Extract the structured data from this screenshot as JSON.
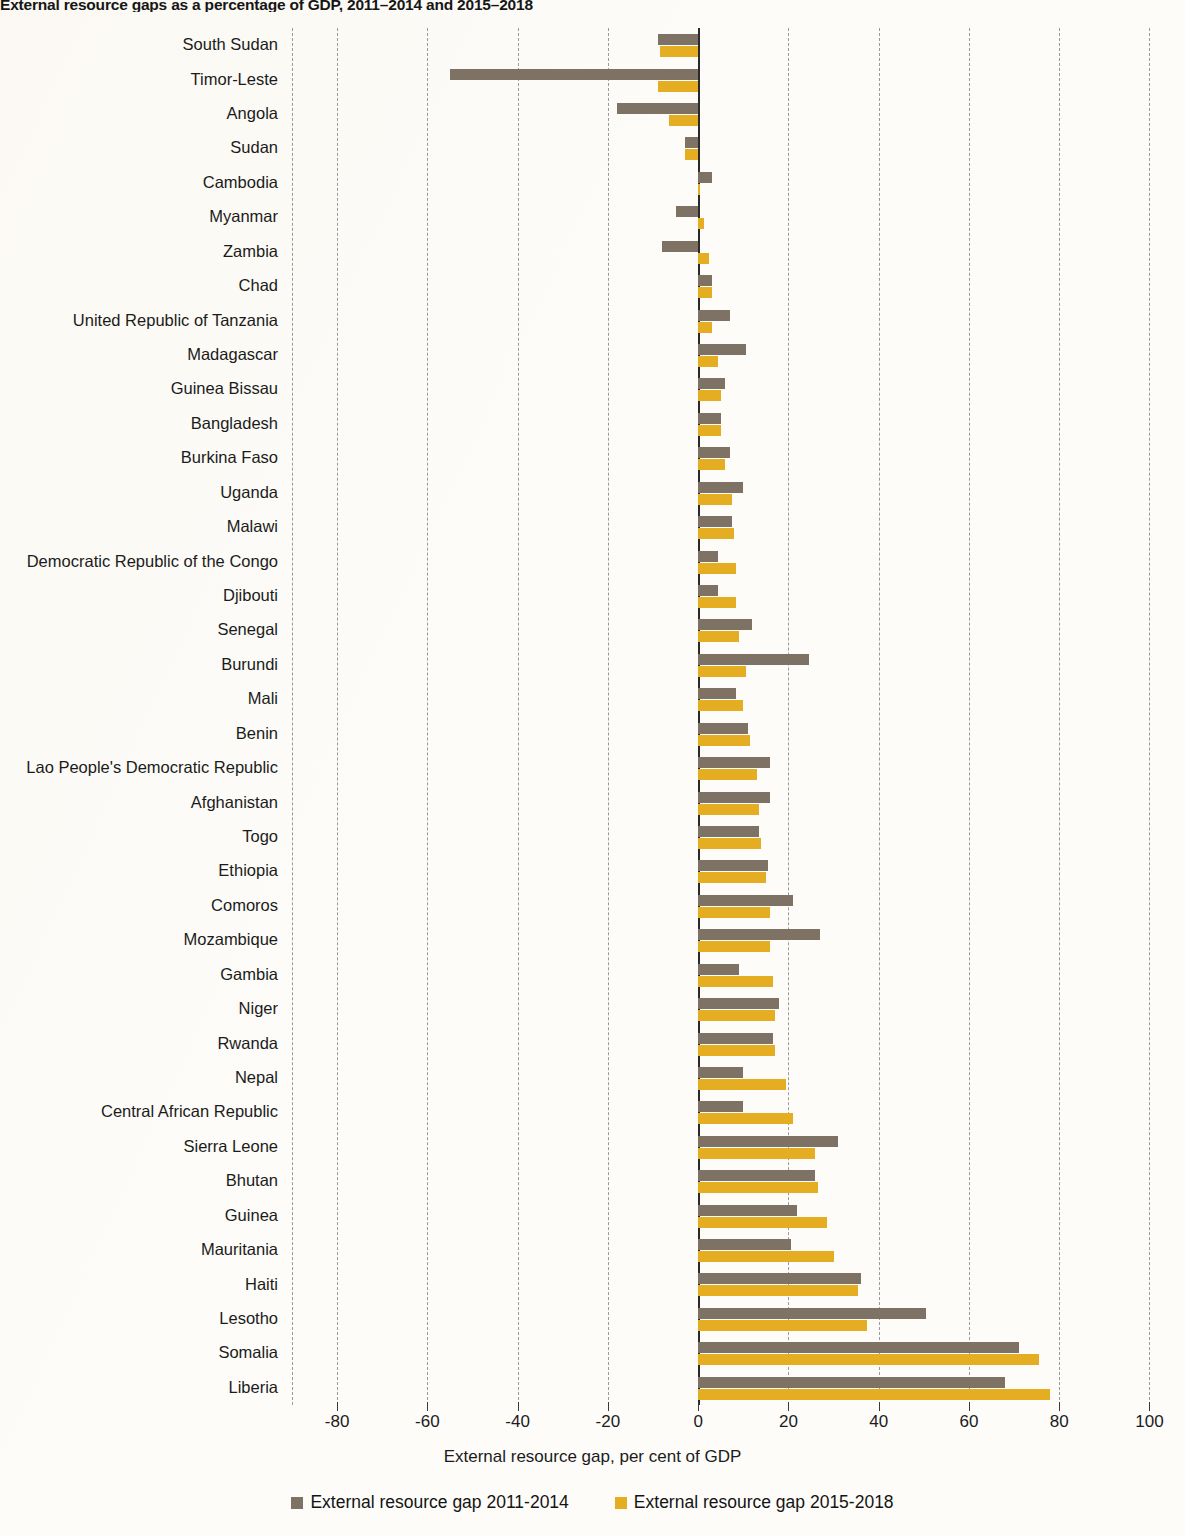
{
  "title": "External resource gaps as a percentage of GDP, 2011–2014 and 2015–2018",
  "axis": {
    "xlabel": "External resource gap, per cent of GDP",
    "xticks": [
      "-80",
      "-60",
      "-40",
      "-20",
      "0",
      "20",
      "40",
      "60",
      "80",
      "100"
    ]
  },
  "legend": {
    "items": [
      {
        "label": "External resource gap 2011-2014",
        "color": "#7d7263"
      },
      {
        "label": "External resource gap 2015-2018",
        "color": "#e5ae22"
      }
    ]
  },
  "colors": {
    "series1": "#7d7263",
    "series2": "#e5ae22",
    "grid": "#9a9a9a",
    "zero_axis": "#2a2a2a",
    "background": "#fdfcf9"
  },
  "chart_data": {
    "type": "bar",
    "orientation": "horizontal",
    "title": "External resource gaps as a percentage of GDP, 2011–2014 and 2015–2018",
    "xlabel": "External resource gap, per cent of GDP",
    "ylabel": "",
    "xlim": [
      -90,
      105
    ],
    "xticks": [
      -80,
      -60,
      -40,
      -20,
      0,
      20,
      40,
      60,
      80,
      100
    ],
    "grid": true,
    "legend_position": "bottom",
    "categories": [
      "South Sudan",
      "Timor-Leste",
      "Angola",
      "Sudan",
      "Cambodia",
      "Myanmar",
      "Zambia",
      "Chad",
      "United Republic of Tanzania",
      "Madagascar",
      "Guinea Bissau",
      "Bangladesh",
      "Burkina Faso",
      "Uganda",
      "Malawi",
      "Democratic Republic of the Congo",
      "Djibouti",
      "Senegal",
      "Burundi",
      "Mali",
      "Benin",
      "Lao People's Democratic Republic",
      "Afghanistan",
      "Togo",
      "Ethiopia",
      "Comoros",
      "Mozambique",
      "Gambia",
      "Niger",
      "Rwanda",
      "Nepal",
      "Central African Republic",
      "Sierra Leone",
      "Bhutan",
      "Guinea",
      "Mauritania",
      "Haiti",
      "Lesotho",
      "Somalia",
      "Liberia"
    ],
    "series": [
      {
        "name": "External resource gap 2011-2014",
        "color": "#7d7263",
        "values": [
          -9.0,
          -55.0,
          -18.0,
          -3.0,
          3.0,
          -5.0,
          -8.0,
          3.0,
          7.0,
          10.5,
          6.0,
          5.0,
          7.0,
          10.0,
          7.5,
          4.5,
          4.5,
          12.0,
          24.5,
          8.5,
          11.0,
          16.0,
          16.0,
          13.5,
          15.5,
          21.0,
          27.0,
          9.0,
          18.0,
          16.5,
          10.0,
          10.0,
          31.0,
          26.0,
          22.0,
          20.5,
          36.0,
          50.5,
          71.0,
          68.0
        ]
      },
      {
        "name": "External resource gap 2015-2018",
        "color": "#e5ae22",
        "values": [
          -8.5,
          -9.0,
          -6.5,
          -3.0,
          0.5,
          1.3,
          2.5,
          3.0,
          3.0,
          4.5,
          5.0,
          5.0,
          6.0,
          7.5,
          8.0,
          8.5,
          8.5,
          9.0,
          10.5,
          10.0,
          11.5,
          13.0,
          13.5,
          14.0,
          15.0,
          16.0,
          16.0,
          16.5,
          17.0,
          17.0,
          19.5,
          21.0,
          26.0,
          26.5,
          28.5,
          30.0,
          35.5,
          37.5,
          75.5,
          78.0
        ]
      }
    ]
  }
}
